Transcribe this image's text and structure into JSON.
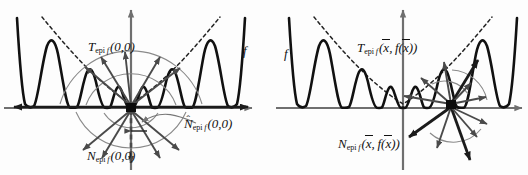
{
  "figure": {
    "background_color": "#fdfdfd",
    "axis_color": "#6f6f6f",
    "curve_color": "#111111",
    "envelope_color": "#222222",
    "cone_arrow_color": "#4a4a4a",
    "arc_color": "#8a8a8a",
    "panels": [
      {
        "name": "left-panel",
        "point_label": "(0,0)",
        "labels": {
          "tangent_cone": "T_epi f (0,0)",
          "normal_cone": "N_epi f (0,0)",
          "regular_normal_cone": "N̂_epi f (0,0)",
          "function": "f"
        }
      },
      {
        "name": "right-panel",
        "point_label": "(x̄, f(x̄))",
        "labels": {
          "tangent_cone": "T_epi f (x̄, f(x̄))",
          "normal_cone": "N_epi f (x̄, f(x̄))",
          "function": "f"
        }
      }
    ],
    "symbols": {
      "T": "T",
      "N": "N",
      "epi": "epi",
      "f": "f",
      "hat": "^",
      "xbar": "x",
      "origin_args": "(0,0)",
      "paren_open": "(",
      "paren_close": ")",
      "comma": ","
    }
  }
}
